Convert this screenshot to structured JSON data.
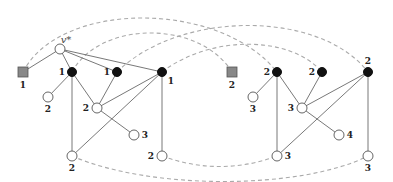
{
  "diagram": {
    "type": "graph",
    "special_vertex_label": "v*",
    "nodes": [
      {
        "id": "s1",
        "kind": "square",
        "x": 23,
        "y": 72,
        "label": "1",
        "lx": 23,
        "ly": 88
      },
      {
        "id": "vstar",
        "kind": "white",
        "x": 60,
        "y": 49,
        "label": "v*",
        "lx": 66,
        "ly": 43
      },
      {
        "id": "a1",
        "kind": "black",
        "x": 72,
        "y": 72,
        "label": "1",
        "lx": 62,
        "ly": 75
      },
      {
        "id": "a2",
        "kind": "black",
        "x": 117,
        "y": 72,
        "label": "1",
        "lx": 107,
        "ly": 75
      },
      {
        "id": "a3",
        "kind": "black",
        "x": 162,
        "y": 72,
        "label": "1",
        "lx": 171,
        "ly": 84
      },
      {
        "id": "b1",
        "kind": "white",
        "x": 48,
        "y": 97,
        "label": "2",
        "lx": 48,
        "ly": 112
      },
      {
        "id": "b2",
        "kind": "white",
        "x": 97,
        "y": 108,
        "label": "2",
        "lx": 86,
        "ly": 111
      },
      {
        "id": "b3",
        "kind": "white",
        "x": 134,
        "y": 135,
        "label": "3",
        "lx": 145,
        "ly": 138
      },
      {
        "id": "b4",
        "kind": "white",
        "x": 72,
        "y": 156,
        "label": "2",
        "lx": 72,
        "ly": 171
      },
      {
        "id": "b5",
        "kind": "white",
        "x": 162,
        "y": 156,
        "label": "2",
        "lx": 151,
        "ly": 159
      },
      {
        "id": "s2",
        "kind": "square",
        "x": 232,
        "y": 72,
        "label": "2",
        "lx": 232,
        "ly": 88
      },
      {
        "id": "c1",
        "kind": "black",
        "x": 277,
        "y": 72,
        "label": "2",
        "lx": 267,
        "ly": 75
      },
      {
        "id": "c2",
        "kind": "black",
        "x": 322,
        "y": 72,
        "label": "2",
        "lx": 312,
        "ly": 75
      },
      {
        "id": "c3",
        "kind": "black",
        "x": 368,
        "y": 72,
        "label": "2",
        "lx": 368,
        "ly": 64
      },
      {
        "id": "d1",
        "kind": "white",
        "x": 253,
        "y": 97,
        "label": "3",
        "lx": 253,
        "ly": 112
      },
      {
        "id": "d2",
        "kind": "white",
        "x": 302,
        "y": 108,
        "label": "3",
        "lx": 291,
        "ly": 111
      },
      {
        "id": "d3",
        "kind": "white",
        "x": 339,
        "y": 135,
        "label": "4",
        "lx": 350,
        "ly": 138
      },
      {
        "id": "d4",
        "kind": "white",
        "x": 277,
        "y": 156,
        "label": "3",
        "lx": 288,
        "ly": 159
      },
      {
        "id": "d5",
        "kind": "white",
        "x": 368,
        "y": 156,
        "label": "3",
        "lx": 368,
        "ly": 171
      }
    ],
    "edges": [
      [
        "s1",
        "vstar"
      ],
      [
        "vstar",
        "a1"
      ],
      [
        "vstar",
        "a2"
      ],
      [
        "vstar",
        "a3"
      ],
      [
        "a1",
        "b1"
      ],
      [
        "a1",
        "b4"
      ],
      [
        "a1",
        "b2"
      ],
      [
        "a2",
        "b2"
      ],
      [
        "a3",
        "b2"
      ],
      [
        "a3",
        "b4"
      ],
      [
        "a3",
        "b5"
      ],
      [
        "b2",
        "b3"
      ],
      [
        "c1",
        "d1"
      ],
      [
        "c1",
        "d4"
      ],
      [
        "c1",
        "d2"
      ],
      [
        "c2",
        "d2"
      ],
      [
        "c3",
        "d2"
      ],
      [
        "c3",
        "d4"
      ],
      [
        "c3",
        "d5"
      ],
      [
        "d2",
        "d3"
      ]
    ],
    "dashed_arcs": [
      {
        "from": "s1",
        "to": "c1",
        "d": "M23,72 C60,0 220,0 277,72"
      },
      {
        "from": "a1",
        "to": "s2",
        "d": "M72,72 C100,20 200,20 232,72"
      },
      {
        "from": "a2",
        "to": "c3",
        "d": "M117,72 C180,10 320,10 368,72"
      },
      {
        "from": "a3",
        "to": "c2",
        "d": "M162,72 C210,35 290,35 322,72"
      },
      {
        "from": "b4",
        "to": "d5",
        "d": "M72,156 C150,190 300,190 368,156"
      },
      {
        "from": "b5",
        "to": "d4",
        "d": "M162,156 C200,170 240,170 277,156"
      }
    ]
  }
}
